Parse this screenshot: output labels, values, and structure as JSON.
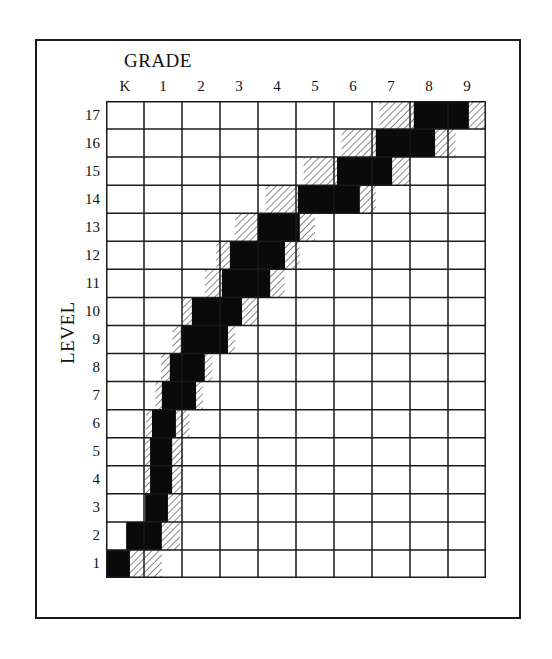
{
  "chart_data": {
    "type": "heatmap",
    "title": "",
    "xlabel": "GRADE",
    "ylabel": "LEVEL",
    "x_categories": [
      "K",
      "1",
      "2",
      "3",
      "4",
      "5",
      "6",
      "7",
      "8",
      "9"
    ],
    "y_categories": [
      "1",
      "2",
      "3",
      "4",
      "5",
      "6",
      "7",
      "8",
      "9",
      "10",
      "11",
      "12",
      "13",
      "14",
      "15",
      "16",
      "17"
    ],
    "grid": true,
    "band": [
      {
        "level": 1,
        "solid": [
          0.0,
          0.63
        ],
        "hatch": [
          0.0,
          1.47
        ]
      },
      {
        "level": 2,
        "solid": [
          0.53,
          1.47
        ],
        "hatch": [
          0.53,
          1.95
        ]
      },
      {
        "level": 3,
        "solid": [
          1.03,
          1.63
        ],
        "hatch": [
          1.03,
          2.0
        ]
      },
      {
        "level": 4,
        "solid": [
          1.16,
          1.74
        ],
        "hatch": [
          1.03,
          2.0
        ]
      },
      {
        "level": 5,
        "solid": [
          1.16,
          1.74
        ],
        "hatch": [
          1.03,
          2.03
        ]
      },
      {
        "level": 6,
        "solid": [
          1.21,
          1.84
        ],
        "hatch": [
          1.05,
          2.2
        ]
      },
      {
        "level": 7,
        "solid": [
          1.47,
          2.37
        ],
        "hatch": [
          1.3,
          2.55
        ]
      },
      {
        "level": 8,
        "solid": [
          1.68,
          2.6
        ],
        "hatch": [
          1.45,
          2.8
        ]
      },
      {
        "level": 9,
        "solid": [
          1.97,
          3.21
        ],
        "hatch": [
          1.75,
          3.4
        ]
      },
      {
        "level": 10,
        "solid": [
          2.26,
          3.58
        ],
        "hatch": [
          2.0,
          4.0
        ]
      },
      {
        "level": 11,
        "solid": [
          3.05,
          4.32
        ],
        "hatch": [
          2.6,
          4.7
        ]
      },
      {
        "level": 12,
        "solid": [
          3.26,
          4.71
        ],
        "hatch": [
          2.9,
          5.1
        ]
      },
      {
        "level": 13,
        "solid": [
          4.0,
          5.1
        ],
        "hatch": [
          3.4,
          5.5
        ]
      },
      {
        "level": 14,
        "solid": [
          5.05,
          6.68
        ],
        "hatch": [
          4.2,
          7.1
        ]
      },
      {
        "level": 15,
        "solid": [
          6.08,
          7.53
        ],
        "hatch": [
          5.2,
          8.0
        ]
      },
      {
        "level": 16,
        "solid": [
          7.1,
          8.66
        ],
        "hatch": [
          6.2,
          9.2
        ]
      },
      {
        "level": 17,
        "solid": [
          8.1,
          9.55
        ],
        "hatch": [
          7.2,
          10.0
        ]
      }
    ]
  },
  "labels": {
    "grade_title": "GRADE",
    "level_title": "LEVEL",
    "grades": [
      "K",
      "1",
      "2",
      "3",
      "4",
      "5",
      "6",
      "7",
      "8",
      "9"
    ],
    "levels": [
      "17",
      "16",
      "15",
      "14",
      "13",
      "12",
      "11",
      "10",
      "9",
      "8",
      "7",
      "6",
      "5",
      "4",
      "3",
      "2",
      "1"
    ]
  }
}
